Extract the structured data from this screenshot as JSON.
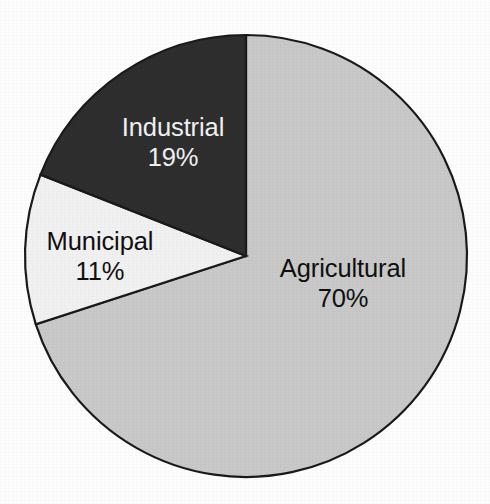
{
  "chart_data": {
    "type": "pie",
    "title": "",
    "subtitle": "",
    "xlabel": "",
    "ylabel": "",
    "legend": "none",
    "grid": false,
    "start_angle_deg": 0,
    "direction": "clockwise",
    "categories": [
      "Agricultural",
      "Municipal",
      "Industrial"
    ],
    "values": [
      70,
      11,
      19
    ],
    "unit": "%",
    "slices": [
      {
        "name": "Agricultural",
        "label": "Agricultural",
        "value": 70,
        "value_label": "70%",
        "color": "#c9c9c9",
        "text_color": "#101010",
        "start_deg": 0,
        "end_deg": 252,
        "label_x": 343,
        "label_line1_y": 277,
        "label_line2_y": 307
      },
      {
        "name": "Municipal",
        "label": "Municipal",
        "value": 11,
        "value_label": "11%",
        "color": "#f1f1f1",
        "text_color": "#101010",
        "start_deg": 252,
        "end_deg": 291.6,
        "label_x": 100,
        "label_line1_y": 250,
        "label_line2_y": 280
      },
      {
        "name": "Industrial",
        "label": "Industrial",
        "value": 19,
        "value_label": "19%",
        "color": "#2e2e2e",
        "text_color": "#f2f2f2",
        "start_deg": 291.6,
        "end_deg": 360,
        "label_x": 173,
        "label_line1_y": 136,
        "label_line2_y": 166
      }
    ],
    "geometry": {
      "center_x": 246,
      "center_y": 256,
      "radius": 221
    },
    "colors": {
      "background": "#fefefe",
      "outline": "#1a1a1a",
      "agricultural": "#c9c9c9",
      "municipal": "#f1f1f1",
      "industrial": "#2e2e2e"
    }
  }
}
